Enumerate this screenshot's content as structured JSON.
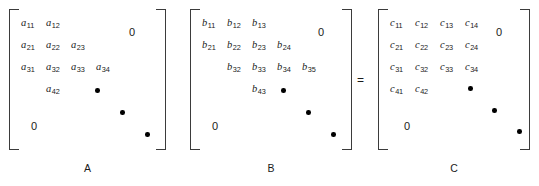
{
  "figure": {
    "type": "matrix-equation",
    "operator": "=",
    "matrices": [
      {
        "id": "A",
        "caption": "A",
        "zero_labels": [
          "0",
          "0"
        ],
        "cells": [
          {
            "base": "a",
            "sub": "11",
            "row": 1,
            "col": 1
          },
          {
            "base": "a",
            "sub": "12",
            "row": 1,
            "col": 2
          },
          {
            "base": "a",
            "sub": "21",
            "row": 2,
            "col": 1
          },
          {
            "base": "a",
            "sub": "22",
            "row": 2,
            "col": 2
          },
          {
            "base": "a",
            "sub": "23",
            "row": 2,
            "col": 3
          },
          {
            "base": "a",
            "sub": "31",
            "row": 3,
            "col": 1
          },
          {
            "base": "a",
            "sub": "32",
            "row": 3,
            "col": 2
          },
          {
            "base": "a",
            "sub": "33",
            "row": 3,
            "col": 3
          },
          {
            "base": "a",
            "sub": "34",
            "row": 3,
            "col": 4
          },
          {
            "base": "a",
            "sub": "42",
            "row": 4,
            "col": 2
          }
        ],
        "dots": 3
      },
      {
        "id": "B",
        "caption": "B",
        "zero_labels": [
          "0",
          "0"
        ],
        "cells": [
          {
            "base": "b",
            "sub": "11",
            "row": 1,
            "col": 1
          },
          {
            "base": "b",
            "sub": "12",
            "row": 1,
            "col": 2
          },
          {
            "base": "b",
            "sub": "13",
            "row": 1,
            "col": 3
          },
          {
            "base": "b",
            "sub": "21",
            "row": 2,
            "col": 1
          },
          {
            "base": "b",
            "sub": "22",
            "row": 2,
            "col": 2
          },
          {
            "base": "b",
            "sub": "23",
            "row": 2,
            "col": 3
          },
          {
            "base": "b",
            "sub": "24",
            "row": 2,
            "col": 4
          },
          {
            "base": "b",
            "sub": "32",
            "row": 3,
            "col": 2
          },
          {
            "base": "b",
            "sub": "33",
            "row": 3,
            "col": 3
          },
          {
            "base": "b",
            "sub": "34",
            "row": 3,
            "col": 4
          },
          {
            "base": "b",
            "sub": "35",
            "row": 3,
            "col": 5
          },
          {
            "base": "b",
            "sub": "43",
            "row": 4,
            "col": 3
          }
        ],
        "dots": 3
      },
      {
        "id": "C",
        "caption": "C",
        "zero_labels": [
          "0",
          "0"
        ],
        "cells": [
          {
            "base": "c",
            "sub": "11",
            "row": 1,
            "col": 1
          },
          {
            "base": "c",
            "sub": "12",
            "row": 1,
            "col": 2
          },
          {
            "base": "c",
            "sub": "13",
            "row": 1,
            "col": 3
          },
          {
            "base": "c",
            "sub": "14",
            "row": 1,
            "col": 4
          },
          {
            "base": "c",
            "sub": "21",
            "row": 2,
            "col": 1
          },
          {
            "base": "c",
            "sub": "22",
            "row": 2,
            "col": 2
          },
          {
            "base": "c",
            "sub": "23",
            "row": 2,
            "col": 3
          },
          {
            "base": "c",
            "sub": "24",
            "row": 2,
            "col": 4
          },
          {
            "base": "c",
            "sub": "31",
            "row": 3,
            "col": 1
          },
          {
            "base": "c",
            "sub": "32",
            "row": 3,
            "col": 2
          },
          {
            "base": "c",
            "sub": "33",
            "row": 3,
            "col": 3
          },
          {
            "base": "c",
            "sub": "34",
            "row": 3,
            "col": 4
          },
          {
            "base": "c",
            "sub": "41",
            "row": 4,
            "col": 1
          },
          {
            "base": "c",
            "sub": "42",
            "row": 4,
            "col": 2
          }
        ],
        "dots": 3
      }
    ]
  },
  "matrixA": {
    "caption": "A",
    "zero_top": "0",
    "zero_bottom": "0",
    "c": {
      "a11": "a",
      "a11s": "11",
      "a12": "a",
      "a12s": "12",
      "a21": "a",
      "a21s": "21",
      "a22": "a",
      "a22s": "22",
      "a23": "a",
      "a23s": "23",
      "a31": "a",
      "a31s": "31",
      "a32": "a",
      "a32s": "32",
      "a33": "a",
      "a33s": "33",
      "a34": "a",
      "a34s": "34",
      "a42": "a",
      "a42s": "42"
    }
  },
  "matrixB": {
    "caption": "B",
    "zero_top": "0",
    "zero_bottom": "0",
    "c": {
      "b11": "b",
      "b11s": "11",
      "b12": "b",
      "b12s": "12",
      "b13": "b",
      "b13s": "13",
      "b21": "b",
      "b21s": "21",
      "b22": "b",
      "b22s": "22",
      "b23": "b",
      "b23s": "23",
      "b24": "b",
      "b24s": "24",
      "b32": "b",
      "b32s": "32",
      "b33": "b",
      "b33s": "33",
      "b34": "b",
      "b34s": "34",
      "b35": "b",
      "b35s": "35",
      "b43": "b",
      "b43s": "43"
    }
  },
  "matrixC": {
    "caption": "C",
    "zero_top": "0",
    "zero_bottom": "0",
    "c": {
      "c11": "c",
      "c11s": "11",
      "c12": "c",
      "c12s": "12",
      "c13": "c",
      "c13s": "13",
      "c14": "c",
      "c14s": "14",
      "c21": "c",
      "c21s": "21",
      "c22": "c",
      "c22s": "22",
      "c23": "c",
      "c23s": "23",
      "c24": "c",
      "c24s": "24",
      "c31": "c",
      "c31s": "31",
      "c32": "c",
      "c32s": "32",
      "c33": "c",
      "c33s": "33",
      "c34": "c",
      "c34s": "34",
      "c41": "c",
      "c41s": "41",
      "c42": "c",
      "c42s": "42"
    }
  },
  "operator": {
    "equals": "="
  }
}
